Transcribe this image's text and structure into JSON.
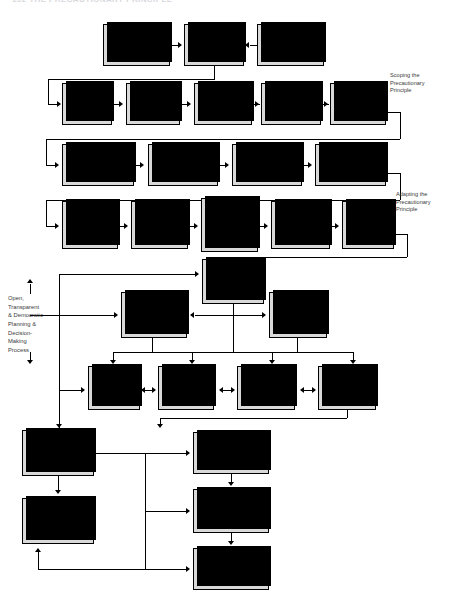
{
  "page": {
    "running_head": "152    THE PRECAUTIONARY PRINCIPLE"
  },
  "diagram": {
    "colors": {
      "node_fill": "#d9d9d9",
      "node_border": "#000000",
      "shadow": "#000000",
      "annotation_text": "#3a3a3a"
    },
    "annotations": [
      {
        "id": "scoping",
        "text": "Scoping the\nPrecautionary\nPrinciple"
      },
      {
        "id": "adapting",
        "text": "Adapting the\nPrecautionary\nPrinciple"
      },
      {
        "id": "open-process",
        "text": "Open,\nTransparent\n& Democratic\nPlanning &\nDecision-\nMaking\nProcess"
      }
    ],
    "rows": [
      {
        "id": "row-initiation",
        "nodes": [
          {
            "id": "precautionary-requirements",
            "label": "Precautionary\nRequirements"
          },
          {
            "id": "screening-proposed-action",
            "label": "Screening/\nProposed\nAction"
          },
          {
            "id": "precautionary-guidelines",
            "label": "Precautionary\nGuidelines"
          }
        ]
      },
      {
        "id": "row-scoping",
        "nodes": [
          {
            "id": "identify-threat",
            "label": "Identify\nThreat"
          },
          {
            "id": "characterize-problem",
            "label": "Characterize\nProblem"
          },
          {
            "id": "decide-precautionary-definition",
            "label": "Decide on\nPrecautionary\nDefinition"
          },
          {
            "id": "decide-precautionary-concept-type",
            "label": "Decide on\nPrecautionary\nConcept Type"
          },
          {
            "id": "determine-input-requirements",
            "label": "Determine\nInput\nRequirements"
          }
        ]
      },
      {
        "id": "row-design",
        "nodes": [
          {
            "id": "scoping",
            "label": "Scoping"
          },
          {
            "id": "set-goals",
            "label": "Set Goals"
          },
          {
            "id": "design-study",
            "label": "Design Study"
          },
          {
            "id": "identify-proposal-purpose",
            "label": "Identify Proposal\nPurpose, Need &\nAlternatives"
          }
        ]
      },
      {
        "id": "row-adapting",
        "nodes": [
          {
            "id": "decide-what-is-known",
            "label": "Decide What\nIs Known or\nNot Known"
          },
          {
            "id": "determine-harm-thresholds",
            "label": "Determine\nHarm\nThresholds &\nCriteria"
          },
          {
            "id": "determine-scientific-evidence",
            "label": "Determine\nScientific\nEvidence\nThresholds &\nCriteria"
          },
          {
            "id": "determine-decision-rules",
            "label": "Determine\nDecision Rules,\nThresholds &\nCriteria"
          },
          {
            "id": "decide-application-principles",
            "label": "Decide on\nApplication\nPrinciples &\nProcedures"
          }
        ]
      },
      {
        "id": "row-assess",
        "nodes": [
          {
            "id": "assess-alternatives",
            "label": "Assess\nAlternatives"
          },
          {
            "id": "refine-proposed-actions",
            "label": "Refine Proposed\nActions"
          },
          {
            "id": "undertake-baseline-analysis",
            "label": "Undertake\nBaseline\nAnalysis"
          }
        ]
      },
      {
        "id": "row-analysis",
        "nodes": [
          {
            "id": "undertake-uncertainty-analysis",
            "label": "Undertake\nUncertainty\nAnalysis"
          },
          {
            "id": "identify-predict-impacts",
            "label": "Identify &\nPredict\nImpacts &\nRisks"
          },
          {
            "id": "integrate-mitigation",
            "label": "Integrate\nMitigation &\nCompensation\nMeasures"
          },
          {
            "id": "interpret-impact-risk",
            "label": "Interpret\nImpact, Risk\n& Uncertainty\nSignificance"
          }
        ]
      },
      {
        "id": "row-decision",
        "nodes": [
          {
            "id": "refine-apply-precautionary",
            "label": "Refine & Apply\nPrecautionary\nThresholds,\nCriteria &\nProcedures"
          },
          {
            "id": "decide-on-action-acceptability",
            "label": "Decide on Action\nAcceptability"
          },
          {
            "id": "prepare-impact-risk-strategy",
            "label": "Prepare Impact,\nRisk & Uncertainty\nManagement\nStrategy"
          },
          {
            "id": "implementation-monitoring",
            "label": "Implementation,\nMonitoring,\nFollow-up &\nEvaluation"
          },
          {
            "id": "decision-making-take-action",
            "label": "Decision Making/\nTake Precautionary\nAction"
          }
        ]
      }
    ]
  }
}
